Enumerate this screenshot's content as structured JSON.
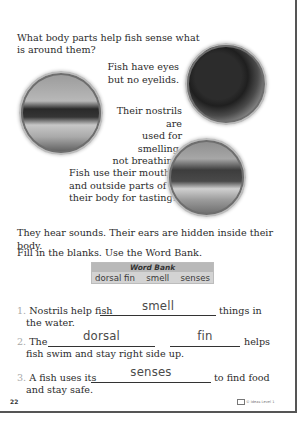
{
  "worksheet": {
    "question": [
      "What body parts help fish sense what",
      "is around them?"
    ],
    "captions": {
      "eyes": [
        "Fish have eyes",
        "but no eyelids."
      ],
      "nostrils": [
        "Their nostrils are",
        "used for smelling,",
        "not breathing."
      ],
      "mouth": [
        "Fish use their mouth",
        "and outside parts of",
        "their body for tasting."
      ]
    },
    "images": {
      "eyes": "fish-eye-photo",
      "nostrils": "fish-nostrils-photo",
      "mouth": "fish-mouth-photo"
    },
    "hearing_text": "They hear sounds. Their ears are hidden inside their body.",
    "instructions": "Fill in the blanks. Use the Word Bank.",
    "word_bank": {
      "title": "Word Bank",
      "words": [
        "dorsal fin",
        "smell",
        "senses"
      ]
    },
    "items": [
      {
        "number": "1.",
        "before": "Nostrils help fish",
        "answer": "smell",
        "after": "things in",
        "line2": "the water."
      },
      {
        "number": "2.",
        "before": "The",
        "answer1": "dorsal",
        "answer2": "fin",
        "after": "helps",
        "line2": "fish swim and stay right side up."
      },
      {
        "number": "3.",
        "before": "A fish uses its",
        "answer": "senses",
        "after": "to find food",
        "line2": "and stay safe."
      }
    ],
    "page_number": "22",
    "copyright": "© Ideas Level 1"
  }
}
